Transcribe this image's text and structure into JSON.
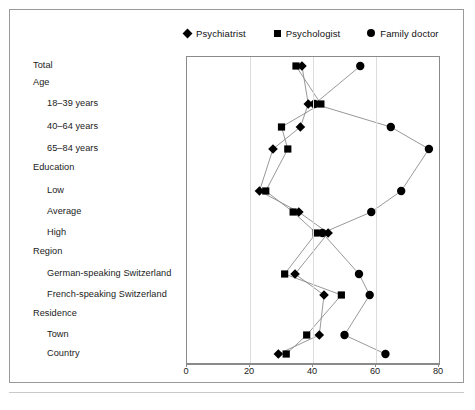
{
  "legend": {
    "items": [
      {
        "label": "Psychiatrist",
        "marker": "diamond-marker-icon",
        "color": "#000000"
      },
      {
        "label": "Psychologist",
        "marker": "square-marker-icon",
        "color": "#000000"
      },
      {
        "label": "Family doctor",
        "marker": "circle-marker-icon",
        "color": "#000000"
      }
    ]
  },
  "axis": {
    "ticks": [
      "0",
      "20",
      "40",
      "60",
      "80"
    ],
    "tick_values": [
      0,
      20,
      40,
      60,
      80
    ]
  },
  "rows": [
    {
      "label": "Total",
      "level": 0
    },
    {
      "label": "Age",
      "level": 0
    },
    {
      "label": "18–39 years",
      "level": 1
    },
    {
      "label": "40–64 years",
      "level": 1
    },
    {
      "label": "65–84 years",
      "level": 1
    },
    {
      "label": "Education",
      "level": 0
    },
    {
      "label": "Low",
      "level": 1
    },
    {
      "label": "Average",
      "level": 1
    },
    {
      "label": "High",
      "level": 1
    },
    {
      "label": "Region",
      "level": 0
    },
    {
      "label": "German-speaking Switzerland",
      "level": 1
    },
    {
      "label": "French-speaking Switzerland",
      "level": 1
    },
    {
      "label": "Residence",
      "level": 0
    },
    {
      "label": "Town",
      "level": 1
    },
    {
      "label": "Country",
      "level": 1
    }
  ],
  "chart_data": {
    "type": "line",
    "orientation": "horizontal",
    "title": "",
    "xlabel": "",
    "ylabel": "",
    "xlim": [
      0,
      80
    ],
    "grid": "vertical-dotted",
    "legend_position": "top",
    "categories": [
      "Total",
      "18–39 years",
      "40–64 years",
      "65–84 years",
      "Low",
      "Average",
      "High",
      "German-speaking Switzerland",
      "French-speaking Switzerland",
      "Town",
      "Country"
    ],
    "series": [
      {
        "name": "Psychiatrist",
        "marker": "diamond",
        "values": [
          36.5,
          38.5,
          36.0,
          27.3,
          23.0,
          35.5,
          44.8,
          34.3,
          43.5,
          42.0,
          29.0
        ]
      },
      {
        "name": "Psychologist",
        "marker": "square",
        "values": [
          34.6,
          42.5,
          30.0,
          32.0,
          25.0,
          33.7,
          41.0,
          31.0,
          49.0,
          38.0,
          31.5
        ]
      },
      {
        "name": "Family doctor",
        "marker": "circle",
        "values": [
          55.0,
          40.5,
          64.7,
          76.8,
          68.0,
          58.5,
          43.0,
          54.6,
          58.0,
          50.0,
          63.0
        ]
      }
    ]
  }
}
